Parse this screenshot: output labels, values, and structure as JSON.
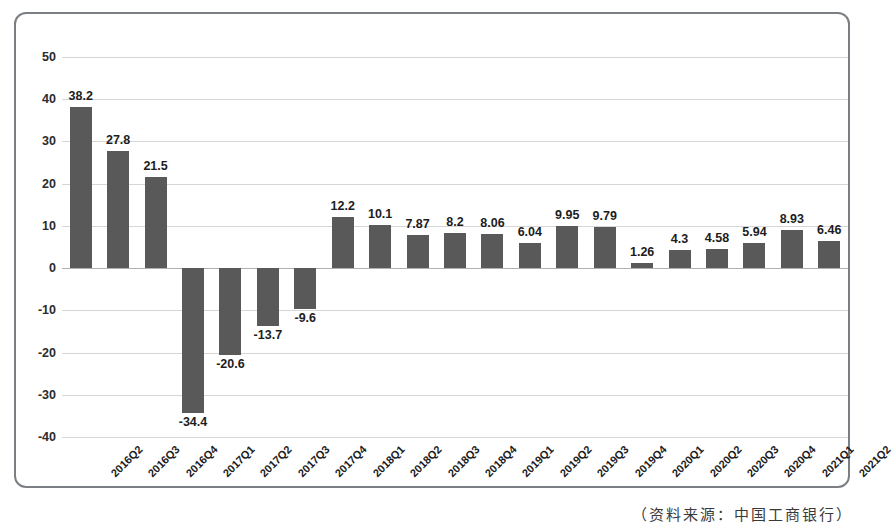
{
  "chart_data": {
    "type": "bar",
    "title": "",
    "subtitle": "",
    "xlabel": "",
    "ylabel": "",
    "ylim": [
      -40,
      50
    ],
    "yticks": [
      50,
      40,
      30,
      20,
      10,
      0,
      -10,
      -20,
      -30,
      -40
    ],
    "grid": true,
    "legend": null,
    "bar_color": "#595959",
    "categories": [
      "2016Q2",
      "2016Q3",
      "2016Q4",
      "2017Q1",
      "2017Q2",
      "2017Q3",
      "2017Q4",
      "2018Q1",
      "2018Q2",
      "2018Q3",
      "2018Q4",
      "2019Q1",
      "2019Q2",
      "2019Q3",
      "2019Q4",
      "2020Q1",
      "2020Q2",
      "2020Q3",
      "2020Q4",
      "2021Q1",
      "2021Q2"
    ],
    "values": [
      38.2,
      27.8,
      21.5,
      -34.4,
      -20.6,
      -13.7,
      -9.6,
      12.2,
      10.1,
      7.87,
      8.2,
      8.06,
      6.04,
      9.95,
      9.79,
      1.26,
      4.3,
      4.58,
      5.94,
      8.93,
      6.46
    ],
    "value_labels": [
      "38.2",
      "27.8",
      "21.5",
      "-34.4",
      "-20.6",
      "-13.7",
      "-9.6",
      "12.2",
      "10.1",
      "7.87",
      "8.2",
      "8.06",
      "6.04",
      "9.95",
      "9.79",
      "1.26",
      "4.3",
      "4.58",
      "5.94",
      "8.93",
      "6.46"
    ]
  },
  "caption": {
    "text": "（资料来源：中国工商银行）"
  }
}
